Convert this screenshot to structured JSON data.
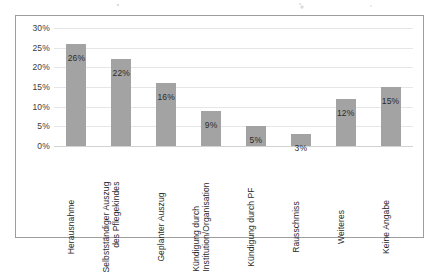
{
  "chart_data": {
    "type": "bar",
    "title": "",
    "subtitle": "",
    "xlabel": "",
    "ylabel": "",
    "ylim": [
      0,
      30
    ],
    "grid": true,
    "legend": "none",
    "orientation": "vertical",
    "value_suffix": "%",
    "bar_color": "#a3a3a3",
    "gridline_color": "#e6e6e6",
    "border_color": "#9d9d9d",
    "label_text_color": "#2b2b2b",
    "y_ticks": [
      "30%",
      "25%",
      "20%",
      "15%",
      "10%",
      "5%",
      "0%"
    ],
    "y_tick_values": [
      30,
      25,
      20,
      15,
      10,
      5,
      0
    ],
    "categories": [
      "Herausnahme",
      "Selbstständiger Auszug des Pflegekindes",
      "Geplanter Auszug",
      "Kündigung durch Institution/Organisation",
      "Kündigung durch PF",
      "Rausschmiss",
      "Weiteres",
      "Keine Angabe"
    ],
    "category_lines": [
      [
        "Herausnahme"
      ],
      [
        "Selbstständiger Auszug",
        "des Pflegekindes"
      ],
      [
        "Geplanter Auszug"
      ],
      [
        "Kündigung durch",
        "Institution/Organisation"
      ],
      [
        "Kündigung durch PF"
      ],
      [
        "Rausschmiss"
      ],
      [
        "Weiteres"
      ],
      [
        "Keine Angabe"
      ]
    ],
    "values": [
      26,
      22,
      16,
      9,
      5,
      3,
      12,
      15
    ],
    "data_labels": [
      "26%",
      "22%",
      "16%",
      "9%",
      "5%",
      "3%",
      "12%",
      "15%"
    ]
  }
}
